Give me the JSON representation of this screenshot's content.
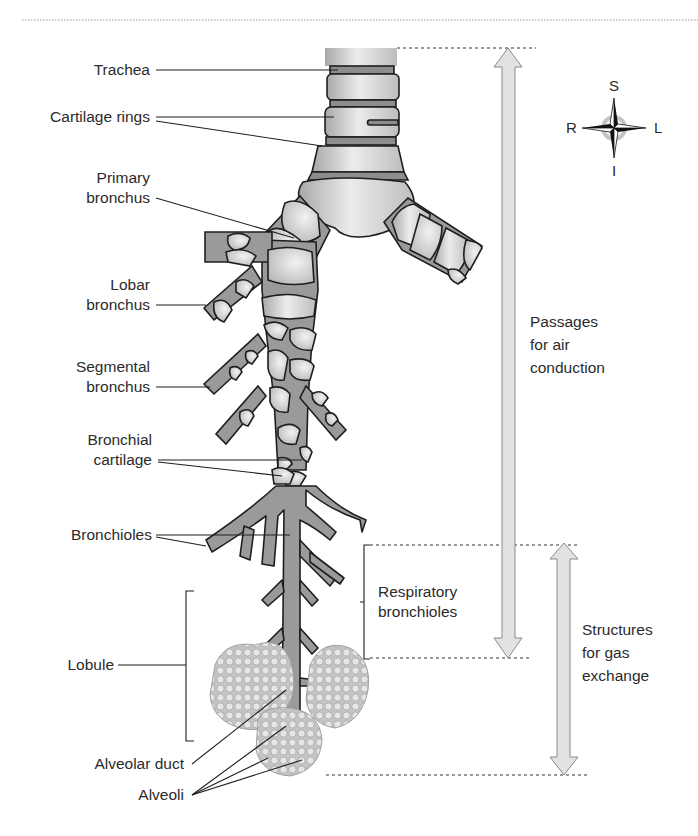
{
  "figure": {
    "colors": {
      "airway_fill": "#9a9a9a",
      "cartilage_fill": "#d8d8d8",
      "outline": "#1e1e1e",
      "arrow_fill": "#e2e2e2",
      "alveoli_fill": "#c9c9c9",
      "text": "#2b2b2b"
    }
  },
  "labels": {
    "trachea": "Trachea",
    "cartilage_rings": "Cartilage rings",
    "primary_bronchus": [
      "Primary",
      "bronchus"
    ],
    "lobar_bronchus": [
      "Lobar",
      "bronchus"
    ],
    "segmental_bronchus": [
      "Segmental",
      "bronchus"
    ],
    "bronchial_cartilage": [
      "Bronchial",
      "cartilage"
    ],
    "bronchioles": "Bronchioles",
    "respiratory_bronchioles": [
      "Respiratory",
      "bronchioles"
    ],
    "lobule": "Lobule",
    "alveolar_duct": "Alveolar duct",
    "alveoli": "Alveoli"
  },
  "zones": {
    "air_conduction": [
      "Passages",
      "for air",
      "conduction"
    ],
    "gas_exchange": [
      "Structures",
      "for gas",
      "exchange"
    ]
  },
  "compass": {
    "superior": "S",
    "inferior": "I",
    "right": "R",
    "left": "L"
  }
}
